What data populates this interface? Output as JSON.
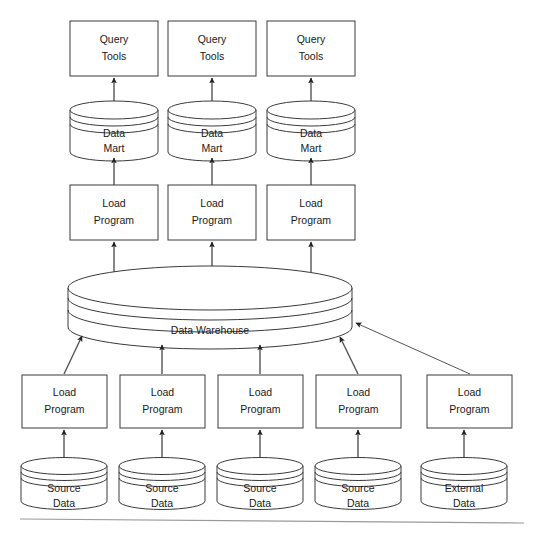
{
  "diagram": {
    "type": "flow-diagram",
    "background_color": "#ffffff",
    "stroke_color": "#3a3a3a",
    "connector_color": "#555555",
    "footer_rule_color": "#9a9a9a"
  },
  "labels": {
    "query_tools": "Query Tools",
    "query_tools_line1": "Query",
    "query_tools_line2": "Tools",
    "data_mart_line1": "Data",
    "data_mart_line2": "Mart",
    "load_program_line1": "Load",
    "load_program_line2": "Program",
    "data_warehouse": "Data Warehouse",
    "source_data_line1": "Source",
    "source_data_line2": "Data",
    "external_data_line1": "External",
    "external_data_line2": "Data"
  },
  "layers": {
    "query_tools": {
      "shape": "rectangle",
      "count": 3,
      "nodes": [
        {
          "id": "query-tools-1",
          "line1": "Query",
          "line2": "Tools"
        },
        {
          "id": "query-tools-2",
          "line1": "Query",
          "line2": "Tools"
        },
        {
          "id": "query-tools-3",
          "line1": "Query",
          "line2": "Tools"
        }
      ]
    },
    "data_marts": {
      "shape": "cylinder",
      "count": 3,
      "nodes": [
        {
          "id": "data-mart-1",
          "line1": "Data",
          "line2": "Mart"
        },
        {
          "id": "data-mart-2",
          "line1": "Data",
          "line2": "Mart"
        },
        {
          "id": "data-mart-3",
          "line1": "Data",
          "line2": "Mart"
        }
      ]
    },
    "mart_load_programs": {
      "shape": "rectangle",
      "count": 3,
      "nodes": [
        {
          "id": "mart-load-program-1",
          "line1": "Load",
          "line2": "Program"
        },
        {
          "id": "mart-load-program-2",
          "line1": "Load",
          "line2": "Program"
        },
        {
          "id": "mart-load-program-3",
          "line1": "Load",
          "line2": "Program"
        }
      ]
    },
    "data_warehouse": {
      "shape": "wide-cylinder",
      "label": "Data Warehouse"
    },
    "source_load_programs": {
      "shape": "rectangle",
      "count": 5,
      "nodes": [
        {
          "id": "source-load-program-1",
          "line1": "Load",
          "line2": "Program"
        },
        {
          "id": "source-load-program-2",
          "line1": "Load",
          "line2": "Program"
        },
        {
          "id": "source-load-program-3",
          "line1": "Load",
          "line2": "Program"
        },
        {
          "id": "source-load-program-4",
          "line1": "Load",
          "line2": "Program"
        },
        {
          "id": "source-load-program-5",
          "line1": "Load",
          "line2": "Program"
        }
      ]
    },
    "sources": {
      "shape": "cylinder",
      "count": 5,
      "nodes": [
        {
          "id": "source-data-1",
          "line1": "Source",
          "line2": "Data"
        },
        {
          "id": "source-data-2",
          "line1": "Source",
          "line2": "Data"
        },
        {
          "id": "source-data-3",
          "line1": "Source",
          "line2": "Data"
        },
        {
          "id": "source-data-4",
          "line1": "Source",
          "line2": "Data"
        },
        {
          "id": "external-data-1",
          "line1": "External",
          "line2": "Data"
        }
      ]
    }
  },
  "flow": {
    "direction": "bottom-to-top",
    "description": "Source Data and External Data feed Load Programs, which load the Data Warehouse; Load Programs then populate Data Marts which serve Query Tools."
  }
}
